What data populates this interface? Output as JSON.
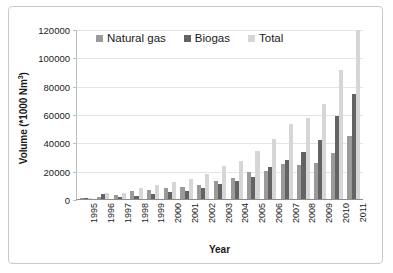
{
  "figure": {
    "border_color": "#c9c9c9",
    "background": "#ffffff"
  },
  "chart_data": {
    "type": "bar",
    "title": "",
    "subtitle": "",
    "xlabel": "Year",
    "ylabel": "Volume (*1000 Nm3)",
    "ylabel_text": "Volume (*1000 Nm",
    "ylabel_sup": "3",
    "ylabel_tail": ")",
    "categories": [
      "1995",
      "1996",
      "1997",
      "1998",
      "1999",
      "2000",
      "2001",
      "2002",
      "2003",
      "2004",
      "2005",
      "2006",
      "2007",
      "2008",
      "2009",
      "2010",
      "2011"
    ],
    "series": [
      {
        "name": "Natural gas",
        "color": "#9a9a9a",
        "values": [
          300,
          1200,
          3000,
          5500,
          6500,
          7500,
          8500,
          9800,
          12800,
          14500,
          18800,
          19800,
          24800,
          24200,
          25300,
          32800,
          44800
        ]
      },
      {
        "name": "Biogas",
        "color": "#636363",
        "values": [
          100,
          3200,
          1500,
          2300,
          3200,
          4700,
          5800,
          7600,
          10800,
          12500,
          15400,
          22800,
          27800,
          33200,
          41800,
          58300,
          74300
        ]
      },
      {
        "name": "Total",
        "color": "#d6d6d6",
        "values": [
          400,
          4400,
          4500,
          7800,
          9700,
          12200,
          14300,
          17400,
          23600,
          27000,
          34200,
          42600,
          52600,
          57400,
          66800,
          91100,
          119100
        ]
      }
    ],
    "yticks": [
      0,
      20000,
      40000,
      60000,
      80000,
      100000,
      120000
    ],
    "ytick_labels": [
      "0",
      "20000",
      "40000",
      "60000",
      "80000",
      "100000",
      "120000"
    ],
    "ylim": [
      0,
      120000
    ],
    "grid": true,
    "grid_color": "#e4e4e4",
    "legend_position": "top-center",
    "legend": [
      "Natural gas",
      "Biogas",
      "Total"
    ]
  }
}
